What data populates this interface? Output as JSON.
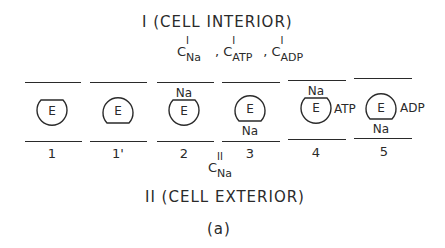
{
  "compartment_interior": {
    "title": "I (CELL INTERIOR)",
    "concentrations": [
      {
        "symbol": "C",
        "superscript": "I",
        "subscript": "Na"
      },
      {
        "symbol": "C",
        "superscript": "I",
        "subscript": "ATP"
      },
      {
        "symbol": "C",
        "superscript": "I",
        "subscript": "ADP"
      }
    ],
    "separator": ","
  },
  "compartment_exterior": {
    "title": "II (CELL EXTERIOR)",
    "concentration": {
      "symbol": "C",
      "superscript": "II",
      "subscript": "Na"
    }
  },
  "states": [
    {
      "number": "1",
      "enzyme": "E",
      "top_ligand": "",
      "bottom_ligand": "",
      "side_ligand": "",
      "shape": "flat-top"
    },
    {
      "number": "1'",
      "enzyme": "E",
      "top_ligand": "",
      "bottom_ligand": "",
      "side_ligand": "",
      "shape": "flat-bottom"
    },
    {
      "number": "2",
      "enzyme": "E",
      "top_ligand": "Na",
      "bottom_ligand": "",
      "side_ligand": "",
      "shape": "flat-top"
    },
    {
      "number": "3",
      "enzyme": "E",
      "top_ligand": "",
      "bottom_ligand": "Na",
      "side_ligand": "",
      "shape": "flat-bottom"
    },
    {
      "number": "4",
      "enzyme": "E",
      "top_ligand": "Na",
      "bottom_ligand": "",
      "side_ligand": "ATP",
      "shape": "flat-top"
    },
    {
      "number": "5",
      "enzyme": "E",
      "top_ligand": "",
      "bottom_ligand": "Na",
      "side_ligand": "ADP",
      "shape": "flat-bottom"
    }
  ],
  "caption": "(a)"
}
